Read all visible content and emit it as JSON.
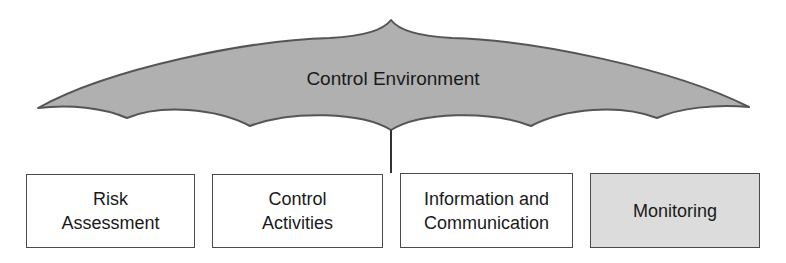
{
  "diagram": {
    "type": "umbrella",
    "umbrella": {
      "label": "Control Environment",
      "fill_color": "#b0b0b0",
      "stroke_color": "#555555"
    },
    "components": [
      {
        "line1": "Risk",
        "line2": "Assessment",
        "fill": "#ffffff"
      },
      {
        "line1": "Control",
        "line2": "Activities",
        "fill": "#ffffff"
      },
      {
        "line1": "Information and",
        "line2": "Communication",
        "fill": "#ffffff"
      },
      {
        "line1": "Monitoring",
        "line2": "",
        "fill": "#dcdcdc"
      }
    ]
  }
}
